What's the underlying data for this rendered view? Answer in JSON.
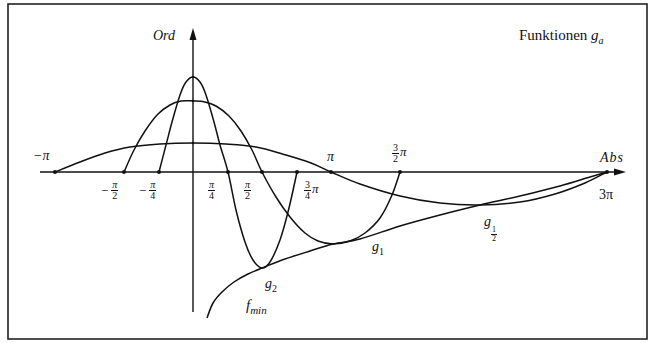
{
  "chart_data": {
    "type": "line",
    "title_text": "Funktionen ",
    "title_symbol": "g",
    "title_sub": "a",
    "xlabel": "Abs",
    "ylabel": "Ord",
    "grid": false,
    "x_ticks": [
      {
        "label": "−π",
        "value": -3.1416
      },
      {
        "label": "−π/2",
        "value": -1.5708
      },
      {
        "label": "−π/4",
        "value": -0.7854
      },
      {
        "label": "π/4",
        "value": 0.7854
      },
      {
        "label": "π/2",
        "value": 1.5708
      },
      {
        "label": "3/4 π",
        "value": 2.3562
      },
      {
        "label": "π",
        "value": 3.1416
      },
      {
        "label": "3/2 π",
        "value": 4.7124
      },
      {
        "label": "3π",
        "value": 9.4248
      }
    ],
    "xlim": [
      -3.5,
      9.8
    ],
    "series": [
      {
        "name": "g2",
        "label": "g",
        "sub": "2",
        "points_px": [
          [
            159,
            172
          ],
          [
            166,
            145
          ],
          [
            172,
            122
          ],
          [
            180,
            95
          ],
          [
            186,
            82
          ],
          [
            193,
            77
          ],
          [
            200,
            82
          ],
          [
            206,
            95
          ],
          [
            214,
            122
          ],
          [
            220,
            145
          ],
          [
            228,
            172
          ],
          [
            236,
            210
          ],
          [
            245,
            242
          ],
          [
            253,
            260
          ],
          [
            262,
            268
          ],
          [
            270,
            262
          ],
          [
            280,
            240
          ],
          [
            289,
            208
          ],
          [
            297,
            172
          ]
        ]
      },
      {
        "name": "g1",
        "label": "g",
        "sub": "1",
        "points_px": [
          [
            124,
            172
          ],
          [
            134,
            150
          ],
          [
            145,
            131
          ],
          [
            158,
            114
          ],
          [
            170,
            105
          ],
          [
            181,
            101
          ],
          [
            193,
            101
          ],
          [
            205,
            102
          ],
          [
            216,
            106
          ],
          [
            229,
            116
          ],
          [
            241,
            131
          ],
          [
            252,
            150
          ],
          [
            262,
            172
          ],
          [
            276,
            197
          ],
          [
            290,
            217
          ],
          [
            305,
            233
          ],
          [
            318,
            241
          ],
          [
            333,
            244
          ],
          [
            350,
            241
          ],
          [
            365,
            233
          ],
          [
            380,
            218
          ],
          [
            392,
            195
          ],
          [
            400,
            172
          ]
        ]
      },
      {
        "name": "g1/2",
        "label": "g",
        "sub": "1/2",
        "points_px": [
          [
            55,
            172
          ],
          [
            80,
            162
          ],
          [
            105,
            153
          ],
          [
            130,
            147
          ],
          [
            160,
            144
          ],
          [
            193,
            143
          ],
          [
            226,
            144
          ],
          [
            256,
            147
          ],
          [
            286,
            155
          ],
          [
            311,
            163
          ],
          [
            331,
            172
          ],
          [
            360,
            184
          ],
          [
            400,
            196
          ],
          [
            440,
            203
          ],
          [
            480,
            205
          ],
          [
            520,
            202
          ],
          [
            555,
            194
          ],
          [
            585,
            183
          ],
          [
            607,
            172
          ]
        ]
      },
      {
        "name": "f_min",
        "label": "f",
        "sub": "min",
        "points_px": [
          [
            207,
            318
          ],
          [
            213,
            303
          ],
          [
            222,
            292
          ],
          [
            234,
            282
          ],
          [
            248,
            274
          ],
          [
            262,
            268
          ],
          [
            285,
            259
          ],
          [
            310,
            251
          ],
          [
            333,
            244
          ],
          [
            360,
            239
          ],
          [
            400,
            226
          ],
          [
            440,
            215
          ],
          [
            480,
            205
          ],
          [
            520,
            196
          ],
          [
            560,
            186
          ],
          [
            590,
            177
          ],
          [
            607,
            172
          ]
        ]
      }
    ],
    "peaks_px": {
      "g2": [
        193,
        77
      ],
      "g1": [
        193,
        101
      ],
      "g1/2": [
        193,
        143
      ]
    },
    "series_labels": [
      {
        "name": "g1",
        "x": 372,
        "y": 240
      },
      {
        "name": "g1/2",
        "x": 484,
        "y": 222
      },
      {
        "name": "g2",
        "x": 265,
        "y": 278
      },
      {
        "name": "f_min",
        "x": 246,
        "y": 298
      }
    ]
  },
  "axes": {
    "ord_label": "Ord",
    "abs_label": "Abs"
  },
  "tick_labels": {
    "neg_pi": "−π",
    "neg_half_pi_sign": "−",
    "neg_half_pi_num": "π",
    "neg_half_pi_den": "2",
    "neg_quarter_pi_sign": "−",
    "neg_quarter_pi_num": "π",
    "neg_quarter_pi_den": "4",
    "quarter_pi_num": "π",
    "quarter_pi_den": "4",
    "half_pi_num": "π",
    "half_pi_den": "2",
    "three_quarter_num": "3",
    "three_quarter_den": "4",
    "three_quarter_pi": "π",
    "pi": "π",
    "three_half_num": "3",
    "three_half_den": "2",
    "three_half_pi": "π",
    "three_pi": "3π"
  },
  "curve_labels": {
    "g1_main": "g",
    "g1_sub": "1",
    "g2_main": "g",
    "g2_sub": "2",
    "ghalf_main": "g",
    "ghalf_num": "1",
    "ghalf_den": "2",
    "fmin_main": "f",
    "fmin_sub": "min"
  }
}
